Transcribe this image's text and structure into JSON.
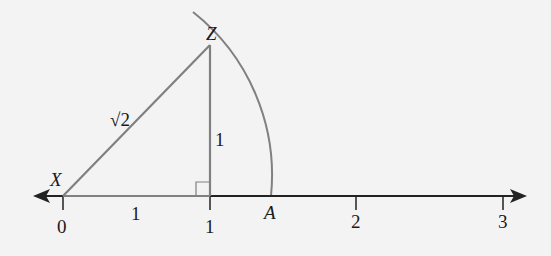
{
  "diagram": {
    "title": "",
    "points": {
      "X": {
        "label": "X",
        "coord": 0
      },
      "Z": {
        "label": "Z"
      },
      "A": {
        "label": "A"
      }
    },
    "segment_labels": {
      "hypotenuse": "√2",
      "base": "1",
      "height": "1"
    },
    "number_line": {
      "ticks": [
        "0",
        "1",
        "2",
        "3"
      ]
    },
    "colors": {
      "triangle": "#808080",
      "arc": "#808080",
      "axis": "#222222",
      "text": "#1a1a1a",
      "background": "#f3f3f3"
    }
  }
}
